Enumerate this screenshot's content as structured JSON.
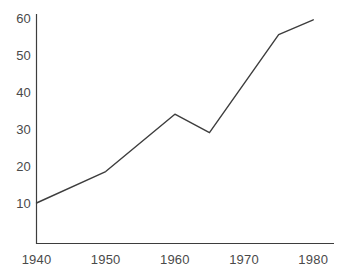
{
  "chart_data": {
    "type": "line",
    "title": "",
    "subtitle": "",
    "xlabel": "",
    "ylabel": "",
    "x": [
      1940,
      1950,
      1960,
      1965,
      1975,
      1980
    ],
    "values": [
      10,
      18.5,
      34,
      29,
      55.5,
      59.5
    ],
    "series": [
      {
        "name": "",
        "x": [
          1940,
          1950,
          1960,
          1965,
          1975,
          1980
        ],
        "values": [
          10,
          18.5,
          34,
          29,
          55.5,
          59.5
        ]
      }
    ],
    "xlim": [
      1940,
      1983
    ],
    "ylim": [
      0,
      62
    ],
    "x_ticks": [
      1940,
      1950,
      1960,
      1970,
      1980
    ],
    "x_tick_labels": [
      "1940",
      "1950",
      "1960",
      "1970",
      "1980"
    ],
    "y_ticks": [
      10,
      20,
      30,
      40,
      50,
      60
    ],
    "y_tick_labels": [
      "10",
      "20",
      "30",
      "40",
      "50",
      "60"
    ],
    "grid": false,
    "legend": false,
    "legend_position": "none",
    "annotations": [],
    "line_color": "#3d3d3d",
    "axis_color": "#3d3d3d",
    "tick_label_color": "#4a4a4a",
    "background_color": "#ffffff"
  },
  "accessibility": {
    "chart_description": "Line chart rising from 10 in 1940 to about 60 in 1980, with a peak of 34 around 1960, a dip to 29 around 1965, then a steep rise."
  }
}
